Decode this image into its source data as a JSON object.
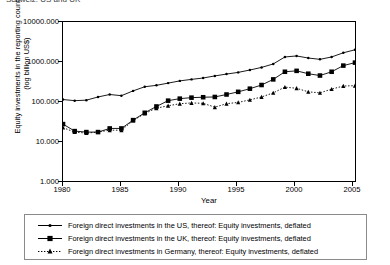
{
  "title_cut": "Schweiz: US and UK",
  "axes": {
    "ylabel_line1": "Equity investments in the reporting country",
    "ylabel_line2": "(log billion US$)",
    "xlabel": "Year",
    "yticks": [
      "10000.000",
      "1000.000",
      "100.000",
      "10.000",
      "1.000"
    ],
    "ytick_values": [
      10000,
      1000,
      100,
      10,
      1
    ],
    "xticks": [
      "1980",
      "1985",
      "1990",
      "1995",
      "2000",
      "2005"
    ],
    "xtick_values": [
      1980,
      1985,
      1990,
      1995,
      2000,
      2005
    ]
  },
  "legend": {
    "items": [
      {
        "marker": "line-solid-dot-marker",
        "label": "Foreign direct investments in the US, thereof: Equity investments, deflated"
      },
      {
        "marker": "line-solid-square-marker",
        "label": "Foreign direct investments in the UK, thereof: Equity investments, deflated"
      },
      {
        "marker": "line-dotted-triangle-marker",
        "label": "Foreign direct investments in Germany, thereof: Equity investments, deflated"
      }
    ]
  },
  "colors": {
    "line": "#000000",
    "frame": "#000000",
    "legend_border": "#8a8a8a",
    "background": "#ffffff"
  },
  "chart_data": {
    "type": "line",
    "title": "",
    "xlabel": "Year",
    "ylabel": "Equity investments in the reporting country (log billion US$)",
    "yscale": "log",
    "ylim": [
      1,
      10000
    ],
    "xlim": [
      1980,
      2005
    ],
    "grid": false,
    "legend_position": "bottom",
    "x": [
      1980,
      1981,
      1982,
      1983,
      1984,
      1985,
      1986,
      1987,
      1988,
      1989,
      1990,
      1991,
      1992,
      1993,
      1994,
      1995,
      1996,
      1997,
      1998,
      1999,
      2000,
      2001,
      2002,
      2003,
      2004,
      2005
    ],
    "series": [
      {
        "name": "Foreign direct investments in the US, thereof: Equity investments, deflated",
        "style": "solid",
        "marker": "dot",
        "values": [
          112,
          105,
          108,
          130,
          150,
          140,
          185,
          235,
          255,
          290,
          330,
          360,
          390,
          440,
          490,
          540,
          620,
          720,
          880,
          1320,
          1400,
          1240,
          1150,
          1320,
          1680,
          2000
        ]
      },
      {
        "name": "Foreign direct investments in the UK, thereof: Equity investments, deflated",
        "style": "solid",
        "marker": "square",
        "values": [
          27,
          18,
          17,
          17,
          21,
          21,
          34,
          52,
          75,
          105,
          118,
          125,
          128,
          130,
          150,
          175,
          210,
          260,
          360,
          560,
          590,
          500,
          450,
          560,
          800,
          950
        ]
      },
      {
        "name": "Foreign direct investments in Germany, thereof: Equity investments, deflated",
        "style": "dotted",
        "marker": "triangle",
        "values": [
          22,
          17,
          16,
          17,
          19,
          19,
          33,
          50,
          68,
          78,
          88,
          92,
          90,
          72,
          88,
          95,
          110,
          130,
          165,
          230,
          215,
          175,
          165,
          205,
          245,
          250
        ]
      }
    ]
  }
}
